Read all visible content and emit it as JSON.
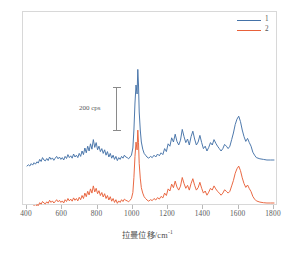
{
  "chart_data": {
    "type": "line",
    "title": "",
    "xlabel": "拉曼位移/cm",
    "xlabel_sup": "-1",
    "ylabel": "",
    "xlim": [
      400,
      1800
    ],
    "xticks": [
      400,
      600,
      800,
      1000,
      1200,
      1400,
      1600,
      1800
    ],
    "xticklabels": [
      "400",
      "600",
      "800",
      "1000",
      "1200",
      "1400",
      "1600",
      "1800"
    ],
    "grid": false,
    "legend_position": "top-right",
    "annotation": {
      "text": "200 cps",
      "x": 990,
      "type": "vertical-scale-bar",
      "value": 200,
      "units": "cps"
    },
    "series": [
      {
        "name": "1",
        "color": "#4472a8",
        "offset_label": "upper",
        "x": [
          400,
          408,
          416,
          424,
          432,
          440,
          448,
          456,
          464,
          472,
          480,
          488,
          496,
          504,
          512,
          520,
          528,
          536,
          544,
          552,
          560,
          568,
          576,
          584,
          592,
          600,
          608,
          616,
          624,
          632,
          640,
          648,
          656,
          664,
          672,
          680,
          688,
          696,
          704,
          712,
          720,
          728,
          736,
          744,
          752,
          760,
          768,
          776,
          784,
          792,
          800,
          808,
          816,
          824,
          832,
          840,
          848,
          856,
          864,
          872,
          880,
          888,
          896,
          904,
          912,
          920,
          928,
          936,
          944,
          952,
          960,
          968,
          976,
          984,
          992,
          1000,
          1006,
          1012,
          1018,
          1024,
          1028,
          1032,
          1036,
          1042,
          1048,
          1056,
          1064,
          1072,
          1080,
          1090,
          1100,
          1110,
          1120,
          1130,
          1140,
          1150,
          1160,
          1170,
          1180,
          1190,
          1200,
          1210,
          1220,
          1230,
          1240,
          1250,
          1260,
          1270,
          1280,
          1290,
          1300,
          1310,
          1320,
          1330,
          1340,
          1350,
          1360,
          1370,
          1380,
          1390,
          1400,
          1410,
          1420,
          1430,
          1440,
          1450,
          1460,
          1470,
          1480,
          1490,
          1500,
          1510,
          1520,
          1530,
          1540,
          1550,
          1560,
          1570,
          1580,
          1590,
          1600,
          1610,
          1620,
          1630,
          1640,
          1650,
          1660,
          1670,
          1680,
          1690,
          1700,
          1720,
          1740,
          1760,
          1780,
          1800
        ],
        "y": [
          30,
          34,
          30,
          38,
          33,
          41,
          36,
          44,
          40,
          52,
          45,
          58,
          50,
          47,
          55,
          48,
          60,
          52,
          57,
          49,
          56,
          62,
          54,
          60,
          52,
          58,
          50,
          62,
          55,
          68,
          58,
          64,
          56,
          70,
          60,
          66,
          58,
          72,
          62,
          80,
          68,
          90,
          74,
          96,
          80,
          104,
          86,
          118,
          92,
          108,
          84,
          96,
          78,
          88,
          72,
          84,
          66,
          78,
          60,
          72,
          56,
          66,
          52,
          62,
          48,
          58,
          52,
          62,
          56,
          66,
          60,
          58,
          54,
          60,
          66,
          90,
          150,
          240,
          300,
          270,
          352,
          300,
          210,
          150,
          110,
          86,
          72,
          66,
          60,
          56,
          62,
          58,
          66,
          60,
          70,
          64,
          74,
          68,
          88,
          78,
          104,
          96,
          124,
          110,
          136,
          112,
          100,
          116,
          152,
          128,
          108,
          120,
          100,
          128,
          146,
          120,
          100,
          110,
          132,
          108,
          88,
          96,
          80,
          92,
          108,
          100,
          118,
          106,
          96,
          88,
          80,
          88,
          102,
          96,
          88,
          96,
          118,
          140,
          168,
          186,
          196,
          178,
          150,
          128,
          112,
          122,
          108,
          96,
          76,
          66,
          58,
          54,
          52,
          50,
          50,
          50
        ],
        "baseline": 50
      },
      {
        "name": "2",
        "color": "#e8613a",
        "offset_label": "lower",
        "x": [
          400,
          408,
          416,
          424,
          432,
          440,
          448,
          456,
          464,
          472,
          480,
          488,
          496,
          504,
          512,
          520,
          528,
          536,
          544,
          552,
          560,
          568,
          576,
          584,
          592,
          600,
          608,
          616,
          624,
          632,
          640,
          648,
          656,
          664,
          672,
          680,
          688,
          696,
          704,
          712,
          720,
          728,
          736,
          744,
          752,
          760,
          768,
          776,
          784,
          792,
          800,
          808,
          816,
          824,
          832,
          840,
          848,
          856,
          864,
          872,
          880,
          888,
          896,
          904,
          912,
          920,
          928,
          936,
          944,
          952,
          960,
          968,
          976,
          984,
          992,
          1000,
          1006,
          1012,
          1018,
          1024,
          1028,
          1032,
          1036,
          1042,
          1048,
          1056,
          1064,
          1072,
          1080,
          1090,
          1100,
          1110,
          1120,
          1130,
          1140,
          1150,
          1160,
          1170,
          1180,
          1190,
          1200,
          1210,
          1220,
          1230,
          1240,
          1250,
          1260,
          1270,
          1280,
          1290,
          1300,
          1310,
          1320,
          1330,
          1340,
          1350,
          1360,
          1370,
          1380,
          1390,
          1400,
          1410,
          1420,
          1430,
          1440,
          1450,
          1460,
          1470,
          1480,
          1490,
          1500,
          1510,
          1520,
          1530,
          1540,
          1550,
          1560,
          1570,
          1580,
          1590,
          1600,
          1610,
          1620,
          1630,
          1640,
          1650,
          1660,
          1670,
          1680,
          1690,
          1700,
          1720,
          1740,
          1760,
          1780,
          1800
        ],
        "y": [
          26,
          30,
          26,
          34,
          29,
          37,
          32,
          40,
          36,
          46,
          41,
          50,
          45,
          42,
          49,
          44,
          54,
          47,
          52,
          45,
          50,
          56,
          49,
          54,
          47,
          52,
          45,
          56,
          50,
          60,
          52,
          58,
          51,
          62,
          54,
          60,
          52,
          64,
          56,
          70,
          60,
          78,
          66,
          84,
          72,
          92,
          78,
          102,
          82,
          94,
          76,
          86,
          70,
          80,
          65,
          76,
          60,
          70,
          55,
          66,
          51,
          60,
          47,
          56,
          44,
          52,
          47,
          56,
          50,
          58,
          54,
          52,
          49,
          54,
          60,
          80,
          130,
          200,
          248,
          222,
          288,
          246,
          176,
          128,
          96,
          78,
          66,
          60,
          55,
          51,
          56,
          53,
          60,
          55,
          63,
          58,
          67,
          62,
          78,
          70,
          92,
          85,
          108,
          96,
          118,
          98,
          88,
          101,
          130,
          110,
          94,
          104,
          88,
          110,
          126,
          104,
          88,
          96,
          114,
          94,
          78,
          85,
          71,
          81,
          94,
          88,
          102,
          92,
          84,
          78,
          71,
          78,
          89,
          84,
          78,
          84,
          102,
          120,
          144,
          159,
          168,
          153,
          129,
          110,
          97,
          105,
          93,
          83,
          67,
          58,
          52,
          48,
          46,
          45,
          45,
          45
        ],
        "baseline": 45
      }
    ]
  },
  "legend": {
    "items": [
      {
        "label": "1",
        "color": "#4472a8"
      },
      {
        "label": "2",
        "color": "#e8613a"
      }
    ]
  }
}
